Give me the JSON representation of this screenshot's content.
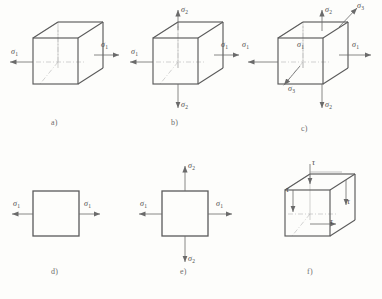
{
  "figure": {
    "background_color": "#fdfdfb",
    "line_color": "#5a5a5a",
    "hidden_line_color": "#b0b0b0",
    "axis_line_color": "#9a9a9a",
    "text_color": "#4a4a4a",
    "caption_color": "#6d6d6d"
  },
  "symbols": {
    "sigma": "σ",
    "tau": "τ",
    "sub_1": "1",
    "sub_2": "2",
    "sub_3": "3"
  },
  "panels": [
    {
      "id": "a",
      "caption": "a)",
      "shape": "cube",
      "description": "uniaxial stress state on a cubic element",
      "stress_labels": [
        {
          "name": "sigma-1-left",
          "symbol": "σ",
          "subscript": "1",
          "direction": "left"
        },
        {
          "name": "sigma-1-right",
          "symbol": "σ",
          "subscript": "1",
          "direction": "right"
        }
      ]
    },
    {
      "id": "b",
      "caption": "b)",
      "shape": "cube",
      "description": "biaxial stress state on a cubic element",
      "stress_labels": [
        {
          "name": "sigma-1-left",
          "symbol": "σ",
          "subscript": "1",
          "direction": "left"
        },
        {
          "name": "sigma-1-right",
          "symbol": "σ",
          "subscript": "1",
          "direction": "right"
        },
        {
          "name": "sigma-2-top",
          "symbol": "σ",
          "subscript": "2",
          "direction": "up"
        },
        {
          "name": "sigma-2-bottom",
          "symbol": "σ",
          "subscript": "2",
          "direction": "down"
        }
      ]
    },
    {
      "id": "c",
      "caption": "c)",
      "shape": "cube",
      "description": "triaxial stress state on a cubic element",
      "stress_labels": [
        {
          "name": "sigma-1-left",
          "symbol": "σ",
          "subscript": "1",
          "direction": "left"
        },
        {
          "name": "sigma-1-right",
          "symbol": "σ",
          "subscript": "1",
          "direction": "right"
        },
        {
          "name": "sigma-2-top",
          "symbol": "σ",
          "subscript": "2",
          "direction": "up"
        },
        {
          "name": "sigma-2-bottom",
          "symbol": "σ",
          "subscript": "2",
          "direction": "down"
        },
        {
          "name": "sigma-3-upper-right",
          "symbol": "σ",
          "subscript": "3",
          "direction": "up-right"
        },
        {
          "name": "sigma-3-lower-left",
          "symbol": "σ",
          "subscript": "3",
          "direction": "down-left"
        }
      ]
    },
    {
      "id": "d",
      "caption": "d)",
      "shape": "square",
      "description": "uniaxial stress state on a plane element",
      "stress_labels": [
        {
          "name": "sigma-1-left",
          "symbol": "σ",
          "subscript": "1",
          "direction": "left"
        },
        {
          "name": "sigma-1-right",
          "symbol": "σ",
          "subscript": "1",
          "direction": "right"
        }
      ]
    },
    {
      "id": "e",
      "caption": "e)",
      "shape": "square",
      "description": "biaxial stress state on a plane element",
      "stress_labels": [
        {
          "name": "sigma-1-left",
          "symbol": "σ",
          "subscript": "1",
          "direction": "left"
        },
        {
          "name": "sigma-1-right",
          "symbol": "σ",
          "subscript": "1",
          "direction": "right"
        },
        {
          "name": "sigma-2-top",
          "symbol": "σ",
          "subscript": "2",
          "direction": "up"
        },
        {
          "name": "sigma-2-bottom",
          "symbol": "σ",
          "subscript": "2",
          "direction": "down"
        }
      ]
    },
    {
      "id": "f",
      "caption": "f)",
      "shape": "cube",
      "description": "pure shear stress state on a cubic element",
      "stress_labels": [
        {
          "name": "tau-top",
          "symbol": "τ",
          "subscript": "",
          "direction": "down"
        },
        {
          "name": "tau-left",
          "symbol": "τ",
          "subscript": "",
          "direction": "down"
        },
        {
          "name": "tau-right",
          "symbol": "τ",
          "subscript": "",
          "direction": "down"
        },
        {
          "name": "tau-bottom",
          "symbol": "τ",
          "subscript": "",
          "direction": "right"
        }
      ]
    }
  ]
}
